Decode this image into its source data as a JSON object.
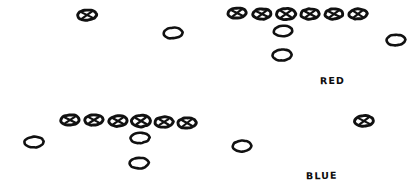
{
  "diagram": {
    "background_color": "#ffffff",
    "ink_color": "#111111",
    "width": 418,
    "height": 192,
    "labels": [
      {
        "name": "red-team-label",
        "text": "RED",
        "x": 320,
        "y": 75,
        "color": "#111111"
      },
      {
        "name": "blue-team-label",
        "text": "BLUE",
        "x": 306,
        "y": 170,
        "color": "#111111"
      }
    ],
    "marker_styles": {
      "marked": "ellipse-with-x-glyph",
      "plain": "open-ellipse"
    },
    "markers": [
      {
        "id": "r-wr-left",
        "team": "RED",
        "style": "marked",
        "cx": 87,
        "cy": 15,
        "rx": 9.5,
        "ry": 5.2,
        "rot": -4
      },
      {
        "id": "r-te-slot",
        "team": "RED",
        "style": "plain",
        "cx": 173,
        "cy": 33,
        "rx": 9.5,
        "ry": 5.4,
        "rot": -4
      },
      {
        "id": "r-line-1",
        "team": "RED",
        "style": "marked",
        "cx": 237,
        "cy": 13,
        "rx": 9.2,
        "ry": 5.2,
        "rot": -5
      },
      {
        "id": "r-line-2",
        "team": "RED",
        "style": "marked",
        "cx": 262,
        "cy": 14,
        "rx": 9.2,
        "ry": 5.2,
        "rot": -3
      },
      {
        "id": "r-line-3",
        "team": "RED",
        "style": "marked",
        "cx": 286,
        "cy": 14,
        "rx": 9.6,
        "ry": 5.6,
        "rot": -2
      },
      {
        "id": "r-line-4",
        "team": "RED",
        "style": "marked",
        "cx": 310,
        "cy": 14,
        "rx": 9.2,
        "ry": 5.2,
        "rot": -3
      },
      {
        "id": "r-line-5",
        "team": "RED",
        "style": "marked",
        "cx": 334,
        "cy": 14,
        "rx": 9.0,
        "ry": 5.0,
        "rot": -4
      },
      {
        "id": "r-line-6",
        "team": "RED",
        "style": "marked",
        "cx": 358,
        "cy": 14,
        "rx": 9.0,
        "ry": 5.0,
        "rot": -3
      },
      {
        "id": "r-qb",
        "team": "RED",
        "style": "plain",
        "cx": 283,
        "cy": 31,
        "rx": 9.4,
        "ry": 5.2,
        "rot": -3
      },
      {
        "id": "r-rb",
        "team": "RED",
        "style": "plain",
        "cx": 282,
        "cy": 55,
        "rx": 9.6,
        "ry": 5.4,
        "rot": -3
      },
      {
        "id": "r-wr-right",
        "team": "RED",
        "style": "plain",
        "cx": 396,
        "cy": 40,
        "rx": 9.4,
        "ry": 5.4,
        "rot": -3
      },
      {
        "id": "b-line-1",
        "team": "BLUE",
        "style": "marked",
        "cx": 70,
        "cy": 120,
        "rx": 9.2,
        "ry": 5.2,
        "rot": -4
      },
      {
        "id": "b-line-2",
        "team": "BLUE",
        "style": "marked",
        "cx": 94,
        "cy": 120,
        "rx": 9.2,
        "ry": 5.2,
        "rot": -3
      },
      {
        "id": "b-line-3",
        "team": "BLUE",
        "style": "marked",
        "cx": 118,
        "cy": 121,
        "rx": 9.2,
        "ry": 5.2,
        "rot": -3
      },
      {
        "id": "b-line-4",
        "team": "BLUE",
        "style": "marked",
        "cx": 141,
        "cy": 121,
        "rx": 9.8,
        "ry": 5.7,
        "rot": -2
      },
      {
        "id": "b-line-5",
        "team": "BLUE",
        "style": "marked",
        "cx": 164,
        "cy": 122,
        "rx": 9.2,
        "ry": 5.2,
        "rot": -3
      },
      {
        "id": "b-line-6",
        "team": "BLUE",
        "style": "marked",
        "cx": 187,
        "cy": 123,
        "rx": 9.2,
        "ry": 5.2,
        "rot": -4
      },
      {
        "id": "b-qb",
        "team": "BLUE",
        "style": "plain",
        "cx": 140,
        "cy": 138,
        "rx": 9.4,
        "ry": 5.2,
        "rot": -3
      },
      {
        "id": "b-rb",
        "team": "BLUE",
        "style": "plain",
        "cx": 139,
        "cy": 163,
        "rx": 9.6,
        "ry": 5.4,
        "rot": -3
      },
      {
        "id": "b-wr-left",
        "team": "BLUE",
        "style": "plain",
        "cx": 34,
        "cy": 142,
        "rx": 9.6,
        "ry": 5.4,
        "rot": -3
      },
      {
        "id": "b-slot",
        "team": "BLUE",
        "style": "plain",
        "cx": 242,
        "cy": 146,
        "rx": 9.4,
        "ry": 5.4,
        "rot": -3
      },
      {
        "id": "b-wr-right",
        "team": "BLUE",
        "style": "marked",
        "cx": 364,
        "cy": 121,
        "rx": 9.4,
        "ry": 5.4,
        "rot": -4
      }
    ]
  }
}
